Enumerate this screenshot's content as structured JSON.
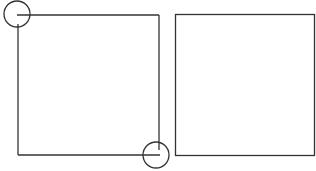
{
  "diagram": {
    "colors": {
      "stroke": "#333333",
      "background": "#ffffff"
    },
    "left_square": {
      "x1": 17,
      "y1": 15,
      "x2": 159,
      "y2": 155,
      "markers": [
        {
          "name": "top-left-corner-marker",
          "cx": 17,
          "cy": 14,
          "r": 13
        },
        {
          "name": "bottom-right-corner-marker",
          "cx": 156,
          "cy": 155,
          "r": 13
        }
      ]
    },
    "right_square": {
      "x": 175,
      "y": 14,
      "width": 139,
      "height": 141
    }
  }
}
